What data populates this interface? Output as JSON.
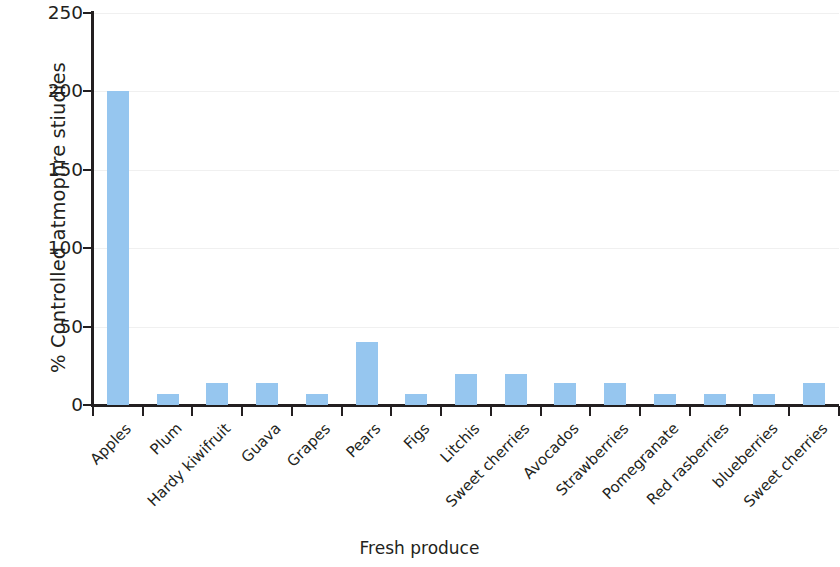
{
  "chart_data": {
    "type": "bar",
    "title": "",
    "xlabel": "Fresh produce",
    "ylabel": "% Controlled atmophre stiudies",
    "ylim": [
      0,
      250
    ],
    "ytick_labels": [
      "250",
      "200",
      "150",
      "100",
      "50",
      "0"
    ],
    "ytick_values": [
      250,
      200,
      150,
      100,
      50,
      0
    ],
    "grid": true,
    "grid_axis": "y",
    "legend": null,
    "bar_color": "#96c6ef",
    "axis_color": "#231f20",
    "categories": [
      "Apples",
      "Plum",
      "Hardy kiwifruit",
      "Guava",
      "Grapes",
      "Pears",
      "Figs",
      "Litchis",
      "Sweet cherries",
      "Avocados",
      "Strawberries",
      "Pomegranate",
      "Red rasberries",
      "blueberries",
      "Sweet cherries"
    ],
    "values": [
      200,
      7,
      14,
      14,
      7,
      40,
      7,
      20,
      20,
      14,
      14,
      7,
      7,
      7,
      14
    ]
  }
}
